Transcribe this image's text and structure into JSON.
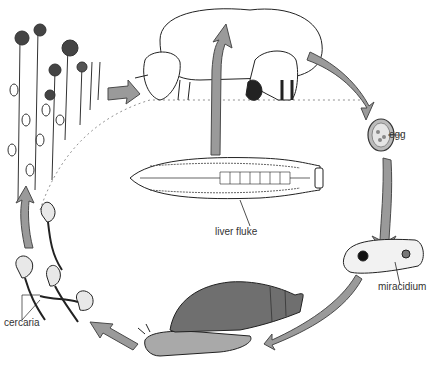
{
  "diagram": {
    "type": "life-cycle",
    "colors": {
      "arrow_fill": "#9a9a9a",
      "arrow_stroke": "#4a4a4a",
      "snail_shell": "#6f6f6f",
      "snail_body": "#a9a9a9",
      "ink": "#222222",
      "label_text": "#333333",
      "background": "#ffffff"
    },
    "stages": [
      {
        "id": "sheep",
        "label": ""
      },
      {
        "id": "egg",
        "label": "egg"
      },
      {
        "id": "miracidium",
        "label": "miracidium"
      },
      {
        "id": "snail",
        "label": ""
      },
      {
        "id": "cercaria",
        "label": "cercaria"
      },
      {
        "id": "vegetation",
        "label": ""
      },
      {
        "id": "liver-fluke",
        "label": "liver fluke"
      }
    ],
    "labels": {
      "egg": "egg",
      "miracidium": "miracidium",
      "cercaria": "cercaria",
      "liver_fluke": "liver fluke"
    }
  }
}
